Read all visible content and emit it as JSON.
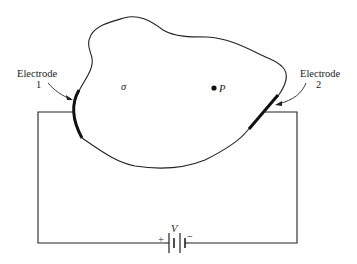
{
  "diagram": {
    "electrode1": {
      "line1": "Electrode",
      "line2": "1"
    },
    "electrode2": {
      "line1": "Electrode",
      "line2": "2"
    },
    "conductivity_symbol": "σ",
    "point_label": "P",
    "battery": {
      "voltage_label": "V",
      "plus": "+",
      "minus": "−"
    }
  }
}
